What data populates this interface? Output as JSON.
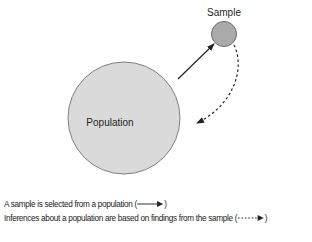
{
  "diagram": {
    "nodes": {
      "population": {
        "label": "Population",
        "fill": "#d9d9d9",
        "stroke": "#7a7a7a"
      },
      "sample": {
        "label": "Sample",
        "fill": "#a9a9a9",
        "stroke": "#6a6a6a"
      }
    },
    "edges": [
      {
        "from": "population",
        "to": "sample",
        "style": "solid",
        "meaning": "selection"
      },
      {
        "from": "sample",
        "to": "population",
        "style": "dashed",
        "meaning": "inference"
      }
    ]
  },
  "legend": {
    "line1": "A sample is selected from a population (",
    "line1_end": ")",
    "line2": "Inferences about a population are based on findings from the sample (",
    "line2_end": ")"
  }
}
